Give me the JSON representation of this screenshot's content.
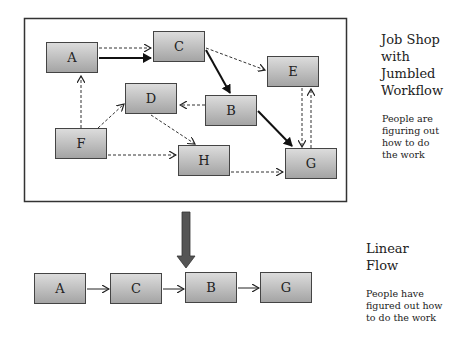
{
  "top_section": {
    "title_lines": [
      "Job Shop",
      "with",
      "Jumbled",
      "Workflow"
    ],
    "note_lines": [
      "People are",
      "figuring out",
      "how to do",
      "the work"
    ],
    "nodes": {
      "A": "A",
      "B": "B",
      "C": "C",
      "D": "D",
      "E": "E",
      "F": "F",
      "G": "G",
      "H": "H"
    }
  },
  "bottom_section": {
    "title_lines": [
      "Linear",
      "Flow"
    ],
    "note_lines": [
      "People have",
      "figured out how",
      "to do the work"
    ],
    "nodes": [
      "A",
      "C",
      "B",
      "G"
    ]
  },
  "colors": {
    "box_top": "#dcdcdc",
    "box_bottom": "#a4a4a4",
    "arrow": "#555555"
  }
}
